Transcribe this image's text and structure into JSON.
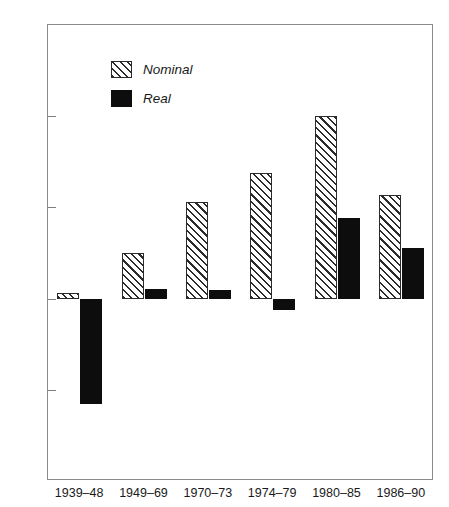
{
  "chart_data": {
    "type": "bar",
    "title": "",
    "subtitle": "",
    "xlabel": "",
    "ylabel": "",
    "categories": [
      "1939–48",
      "1949–69",
      "1970–73",
      "1974–79",
      "1980–85",
      "1986–90"
    ],
    "series": [
      {
        "name": "Nominal",
        "style": "hatched",
        "color": "#2b2b2b",
        "values": [
          0.3,
          2.5,
          5.3,
          6.9,
          10.0,
          5.7
        ]
      },
      {
        "name": "Real",
        "style": "solid",
        "color": "#0d0d0d",
        "values": [
          -5.8,
          0.5,
          0.45,
          -0.6,
          4.4,
          2.8
        ]
      }
    ],
    "ylim": [
      -10,
      15
    ],
    "yticks": [
      15,
      10,
      5,
      0,
      -5,
      -10
    ],
    "ytick_labels": [
      "15",
      "10",
      "5",
      "0",
      "-5",
      "-10"
    ],
    "grid": false,
    "legend_position": "top-left",
    "legend_entries": [
      "Nominal",
      "Real"
    ]
  }
}
